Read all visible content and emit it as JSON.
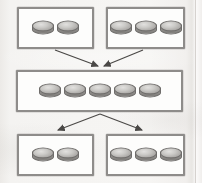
{
  "diagram": {
    "type": "flow",
    "background_color": "#f4f3f1",
    "box_border_color": "#8e8c8a",
    "box_fill_color": "#fdfdfc",
    "disc_color": "#bdbcb9",
    "arrow_color": "#4a4846",
    "nodes": [
      {
        "id": "top-left",
        "label": "",
        "disc_count": 2,
        "x": 17,
        "y": 7,
        "w": 77,
        "h": 42
      },
      {
        "id": "top-right",
        "label": "",
        "disc_count": 3,
        "x": 106,
        "y": 7,
        "w": 79,
        "h": 42
      },
      {
        "id": "middle",
        "label": "",
        "disc_count": 5,
        "x": 16,
        "y": 70,
        "w": 167,
        "h": 42
      },
      {
        "id": "bottom-left",
        "label": "",
        "disc_count": 2,
        "x": 17,
        "y": 134,
        "w": 77,
        "h": 42
      },
      {
        "id": "bottom-right",
        "label": "",
        "disc_count": 3,
        "x": 106,
        "y": 134,
        "w": 79,
        "h": 42
      }
    ],
    "edges": [
      {
        "id": "edge-top-left-to-middle",
        "from": "top-left",
        "to": "middle",
        "direction": "down"
      },
      {
        "id": "edge-top-right-to-middle",
        "from": "top-right",
        "to": "middle",
        "direction": "down"
      },
      {
        "id": "edge-middle-to-bottom-left",
        "from": "middle",
        "to": "bottom-left",
        "direction": "down"
      },
      {
        "id": "edge-middle-to-bottom-right",
        "from": "middle",
        "to": "bottom-right",
        "direction": "down"
      }
    ]
  }
}
